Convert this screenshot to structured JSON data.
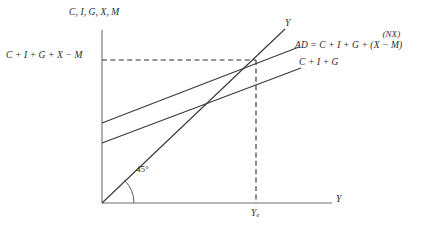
{
  "figure": {
    "type": "keynesian-cross-open-economy",
    "background_color": "#ffffff",
    "line_color": "#3a3a3a",
    "axis_color": "#6e6e6e",
    "text_color": "#2b2b2b"
  },
  "axes": {
    "y_axis_label": "C, I, G, X, M",
    "x_axis_label": "Y",
    "origin": {
      "x": 102,
      "y": 203
    },
    "y_axis_top": 30,
    "x_axis_right": 332
  },
  "labels": {
    "vertical_intercept": "C + I + G + X − M",
    "equilibrium_output": "Y",
    "equilibrium_output_subscript": "e",
    "angle": "45°",
    "forty_five_line": "Y",
    "ad_line": "AD = C + I + G + (X − M)",
    "net_exports_annotation": "(NX)",
    "cig_line": "C + I + G"
  },
  "lines": [
    {
      "name": "forty-five-degree-line",
      "label": "Y",
      "x1": 102,
      "y1": 203,
      "x2": 285,
      "y2": 29
    },
    {
      "name": "aggregate-demand-line",
      "label": "AD = C + I + G + (X − M)",
      "x1": 102,
      "y1": 123,
      "x2": 299,
      "y2": 47
    },
    {
      "name": "domestic-absorption-line",
      "label": "C + I + G",
      "x1": 102,
      "y1": 143,
      "x2": 301,
      "y2": 68
    }
  ],
  "equilibrium": {
    "x": 256,
    "y": 60,
    "dashed_horizontal_from_x": 102,
    "dashed_vertical_to_y": 203
  },
  "angle_arc": {
    "center_x": 102,
    "center_y": 203,
    "radius": 32,
    "value": "45°"
  }
}
